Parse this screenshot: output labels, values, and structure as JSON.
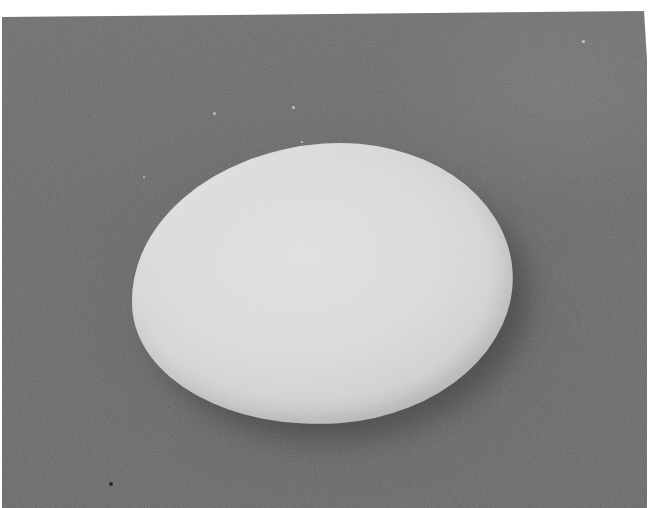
{
  "image": {
    "subject": "egg",
    "description": "Black-and-white photograph of a single egg lying on a dark gray textured background",
    "colors": {
      "background": "#6a6a6a",
      "egg_surface": "#dcdcdc",
      "egg_edge_shade": "#c9c9c9",
      "frame_margin": "#ffffff"
    },
    "egg": {
      "left": 131,
      "top": 144,
      "width": 382,
      "height": 280
    },
    "specks": [
      {
        "x": 111,
        "y": 484,
        "size": 4,
        "color": "#2a2a2a"
      },
      {
        "x": 214,
        "y": 113,
        "size": 3,
        "color": "#bdbdbd"
      },
      {
        "x": 293,
        "y": 107,
        "size": 3,
        "color": "#c4c4c4"
      },
      {
        "x": 302,
        "y": 142,
        "size": 2,
        "color": "#d0d0d0"
      },
      {
        "x": 144,
        "y": 177,
        "size": 2,
        "color": "#b8b8b8"
      },
      {
        "x": 583,
        "y": 41,
        "size": 3,
        "color": "#c8c8c8"
      }
    ]
  }
}
